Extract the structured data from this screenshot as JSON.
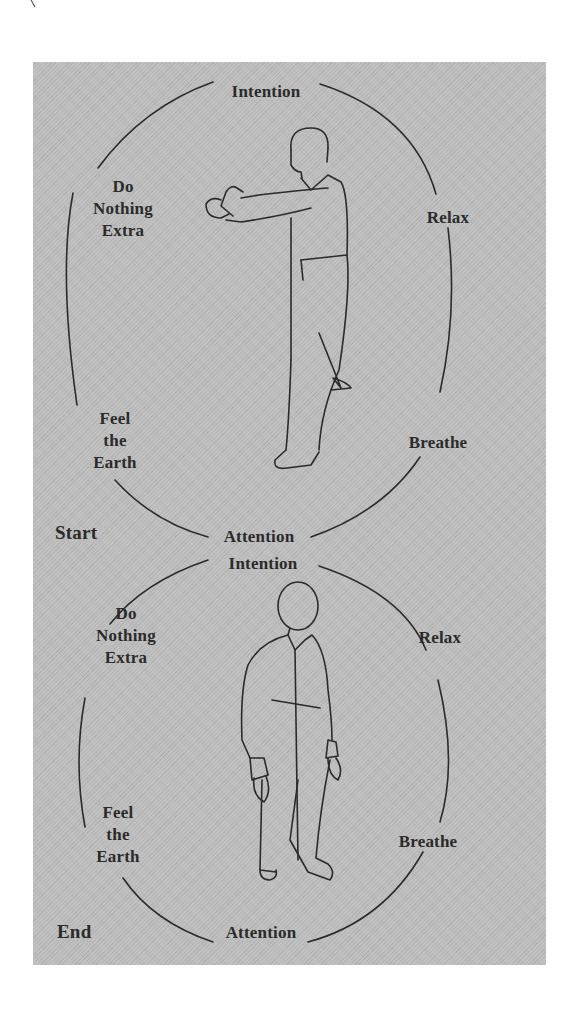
{
  "figure": {
    "background_color": "#bcbcbc",
    "line_color": "#2b2b2b",
    "diagrams": [
      {
        "stage_label": "Start",
        "pose": "stepping-forward-fists-extended",
        "labels": {
          "top": "Intention",
          "upper_left": [
            "Do",
            "Nothing",
            "Extra"
          ],
          "upper_right": "Relax",
          "lower_left": [
            "Feel",
            "the",
            "Earth"
          ],
          "lower_right": "Breathe",
          "bottom": "Attention"
        }
      },
      {
        "stage_label": "End",
        "pose": "standing-arms-relaxed",
        "labels": {
          "top": "Intention",
          "upper_left": [
            "Do",
            "Nothing",
            "Extra"
          ],
          "upper_right": "Relax",
          "lower_left": [
            "Feel",
            "the",
            "Earth"
          ],
          "lower_right": "Breathe",
          "bottom": "Attention"
        }
      }
    ]
  }
}
